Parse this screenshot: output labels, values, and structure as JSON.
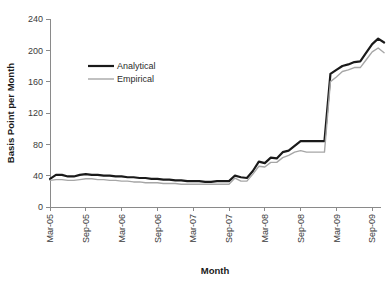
{
  "chart_data": {
    "type": "line",
    "title": "",
    "xlabel": "Month",
    "ylabel": "Basis Point per Month",
    "ylim": [
      0,
      240
    ],
    "yticks": [
      0,
      40,
      80,
      120,
      160,
      200,
      240
    ],
    "grid": false,
    "legend_position": "upper-left-inside",
    "xlabel_rotation": 90,
    "x_tick_labels": [
      "Mar-05",
      "Sep-05",
      "Mar-06",
      "Sep-06",
      "Mar-07",
      "Sep-07",
      "Mar-08",
      "Sep-08",
      "Mar-09",
      "Sep-09"
    ],
    "x": [
      "Mar-05",
      "Apr-05",
      "May-05",
      "Jun-05",
      "Jul-05",
      "Aug-05",
      "Sep-05",
      "Oct-05",
      "Nov-05",
      "Dec-05",
      "Jan-06",
      "Feb-06",
      "Mar-06",
      "Apr-06",
      "May-06",
      "Jun-06",
      "Jul-06",
      "Aug-06",
      "Sep-06",
      "Oct-06",
      "Nov-06",
      "Dec-06",
      "Jan-07",
      "Feb-07",
      "Mar-07",
      "Apr-07",
      "May-07",
      "Jun-07",
      "Jul-07",
      "Aug-07",
      "Sep-07",
      "Oct-07",
      "Nov-07",
      "Dec-07",
      "Jan-08",
      "Feb-08",
      "Mar-08",
      "Apr-08",
      "May-08",
      "Jun-08",
      "Jul-08",
      "Aug-08",
      "Sep-08",
      "Oct-08",
      "Nov-08",
      "Dec-08",
      "Jan-09",
      "Feb-09",
      "Mar-09",
      "Apr-09",
      "May-09",
      "Jun-09",
      "Jul-09",
      "Aug-09",
      "Sep-09",
      "Oct-09",
      "Nov-09"
    ],
    "series": [
      {
        "name": "Analytical",
        "color": "#1a1a1a",
        "width": 2.2,
        "values": [
          36,
          41,
          41,
          39,
          39,
          41,
          42,
          41,
          41,
          40,
          40,
          39,
          39,
          38,
          38,
          37,
          37,
          36,
          36,
          35,
          35,
          34,
          34,
          33,
          33,
          33,
          32,
          32,
          33,
          33,
          33,
          40,
          38,
          37,
          46,
          58,
          56,
          63,
          62,
          70,
          72,
          78,
          84,
          84,
          84,
          84,
          84,
          170,
          175,
          180,
          182,
          185,
          186,
          197,
          208,
          215,
          210
        ]
      },
      {
        "name": "Empirical",
        "color": "#a6a6a6",
        "width": 1.4,
        "values": [
          34,
          35,
          35,
          34,
          34,
          35,
          36,
          36,
          35,
          35,
          34,
          34,
          33,
          33,
          32,
          32,
          31,
          31,
          31,
          30,
          30,
          30,
          29,
          29,
          29,
          29,
          29,
          29,
          29,
          29,
          29,
          37,
          33,
          33,
          42,
          52,
          51,
          57,
          57,
          63,
          66,
          70,
          72,
          70,
          70,
          70,
          70,
          160,
          166,
          173,
          175,
          178,
          178,
          188,
          198,
          203,
          197
        ]
      }
    ]
  },
  "axis": {
    "y_title": "Basis Point per Month",
    "x_title": "Month"
  },
  "legend": {
    "items": [
      {
        "label": "Analytical"
      },
      {
        "label": "Empirical"
      }
    ]
  }
}
